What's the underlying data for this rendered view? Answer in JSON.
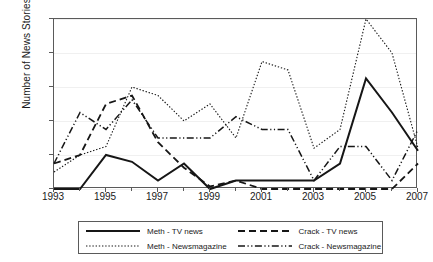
{
  "chart_data": {
    "type": "line",
    "title": "",
    "xlabel": "",
    "ylabel": "Number of News Stories",
    "x": [
      1993,
      1994,
      1995,
      1996,
      1997,
      1998,
      1999,
      2000,
      2001,
      2002,
      2003,
      2004,
      2005,
      2006,
      2007
    ],
    "xlim": [
      1993,
      2007
    ],
    "ylim": [
      0,
      20
    ],
    "yticks": [
      0,
      4,
      8,
      12,
      16,
      20
    ],
    "xticks": [
      1993,
      1995,
      1997,
      1999,
      2001,
      2003,
      2005,
      2007
    ],
    "xticks_minor": [
      1994,
      1996,
      1998,
      2000,
      2002,
      2004,
      2006
    ],
    "grid": true,
    "legend_position": "below",
    "series": [
      {
        "name": "Meth - TV news",
        "style": "solid",
        "values": [
          0,
          0,
          4,
          3.2,
          1,
          3,
          0,
          1,
          1,
          1,
          1,
          3,
          13,
          9,
          4.5
        ]
      },
      {
        "name": "Crack - TV news",
        "style": "dashed",
        "values": [
          3,
          4,
          10,
          11,
          5.5,
          2.5,
          0.3,
          1,
          0,
          0,
          0,
          0,
          0,
          0,
          3
        ]
      },
      {
        "name": "Meth - Newsmagazine",
        "style": "dotted",
        "values": [
          2,
          4,
          5,
          12,
          11,
          8,
          10,
          6,
          15,
          14,
          4.8,
          7,
          20,
          16,
          4.8
        ]
      },
      {
        "name": "Crack - Newsmagazine",
        "style": "dashdot",
        "values": [
          3,
          9,
          7,
          10.5,
          6,
          6,
          6,
          8.5,
          7,
          7,
          1,
          5,
          5,
          1,
          7
        ]
      }
    ]
  },
  "legend": {
    "entries": [
      {
        "label": "Meth - TV news",
        "style": "solid"
      },
      {
        "label": "Crack - TV news",
        "style": "dashed"
      },
      {
        "label": "Meth - Newsmagazine",
        "style": "dotted"
      },
      {
        "label": "Crack - Newsmagazine",
        "style": "dashdot"
      }
    ]
  },
  "colors": {
    "line": "#161616",
    "frame": "#5a5a5a",
    "grid": "#f0f0f0",
    "background": "#ffffff"
  }
}
